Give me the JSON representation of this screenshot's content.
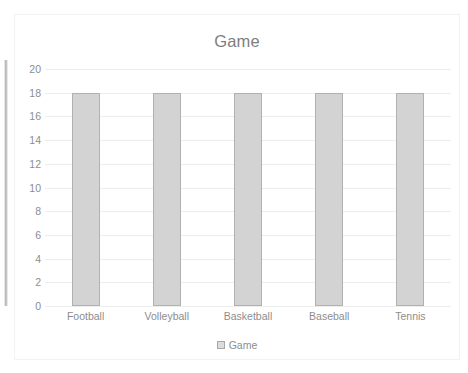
{
  "chart_data": {
    "type": "bar",
    "title": "Game",
    "categories": [
      "Football",
      "Volleyball",
      "Basketball",
      "Baseball",
      "Tennis"
    ],
    "values": [
      18,
      18,
      18,
      18,
      18
    ],
    "series": [
      {
        "name": "Game",
        "values": [
          18,
          18,
          18,
          18,
          18
        ]
      }
    ],
    "xlabel": "",
    "ylabel": "",
    "ylim": [
      0,
      20
    ],
    "ytick_step": 2,
    "yticks": [
      "20",
      "18",
      "16",
      "14",
      "12",
      "10",
      "8",
      "6",
      "4",
      "2",
      "0"
    ],
    "grid": true,
    "legend": {
      "position": "bottom",
      "entries": [
        "Game"
      ]
    },
    "colors": {
      "bar_fill": "#d3d3d3",
      "bar_border": "#b1b1b1",
      "gridline": "#ededed",
      "text": "#8d8d8d",
      "title_text": "#7e7e7e",
      "panel_background": "#ffffff"
    }
  }
}
